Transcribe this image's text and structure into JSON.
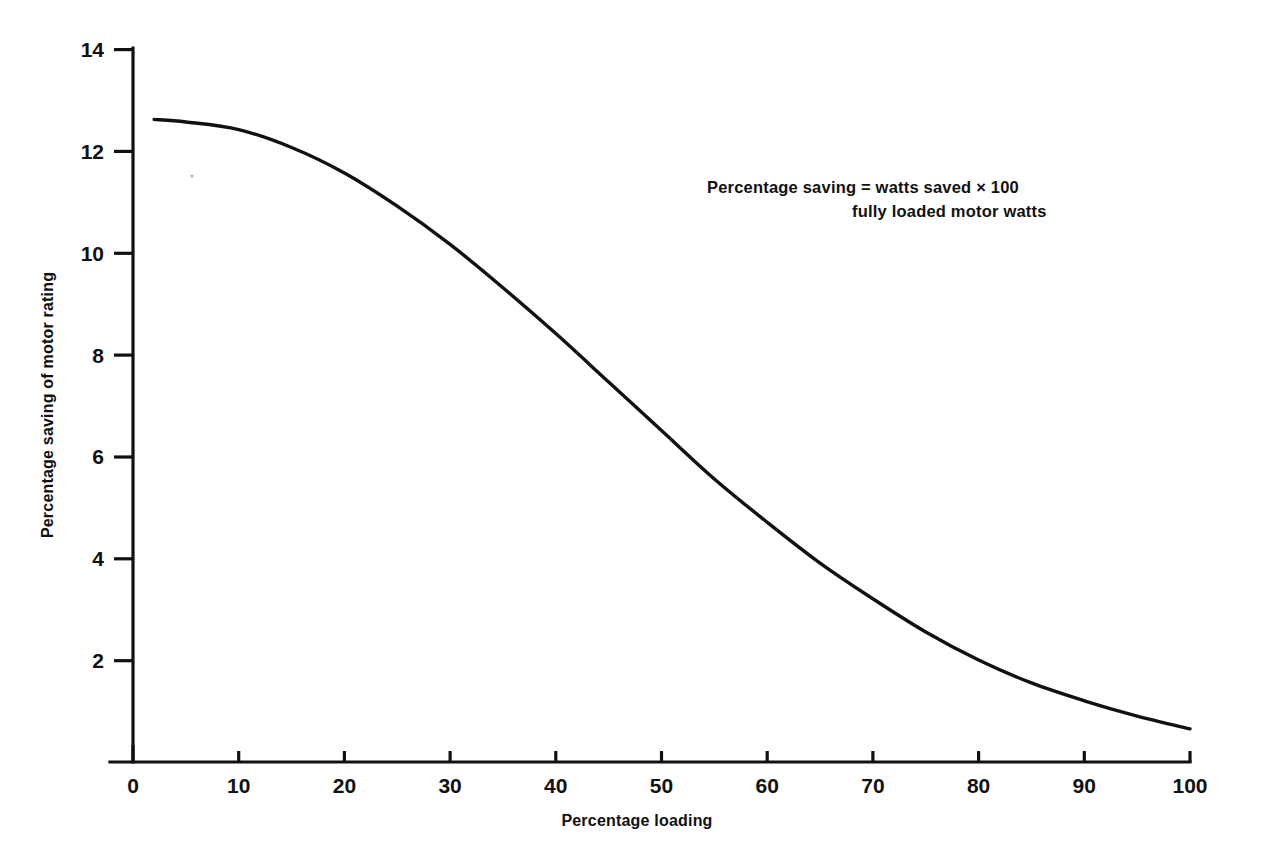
{
  "chart_data": {
    "type": "line",
    "title": "",
    "xlabel": "Percentage loading",
    "ylabel": "Percentage saving of motor rating",
    "xlim": [
      0,
      100
    ],
    "ylim": [
      0,
      14
    ],
    "grid": false,
    "legend": "none",
    "x_ticks": [
      "0",
      "10",
      "20",
      "30",
      "40",
      "50",
      "60",
      "70",
      "80",
      "90",
      "100"
    ],
    "y_ticks": [
      "2",
      "4",
      "6",
      "8",
      "10",
      "12",
      "14"
    ],
    "x_tick_values": [
      0,
      10,
      20,
      30,
      40,
      50,
      60,
      70,
      80,
      90,
      100
    ],
    "y_tick_values": [
      2,
      4,
      6,
      8,
      10,
      12,
      14
    ],
    "series": [
      {
        "name": "Percentage saving of motor rating",
        "x": [
          2,
          5,
          10,
          15,
          20,
          25,
          30,
          35,
          40,
          45,
          50,
          55,
          60,
          65,
          70,
          75,
          80,
          85,
          90,
          95,
          100
        ],
        "values": [
          12.6,
          12.55,
          12.4,
          12.05,
          11.55,
          10.9,
          10.15,
          9.3,
          8.4,
          7.45,
          6.5,
          5.55,
          4.7,
          3.9,
          3.2,
          2.55,
          2.0,
          1.55,
          1.2,
          0.9,
          0.65
        ]
      }
    ],
    "annotations": [
      {
        "name": "percentage-saving-formula",
        "line1": "Percentage saving = watts saved  ×  100",
        "line2": "fully loaded motor watts"
      }
    ]
  }
}
